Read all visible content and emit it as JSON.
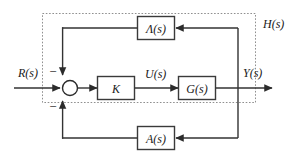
{
  "diagram": {
    "colors": {
      "line": "#333333",
      "block_border": "#3a3a3a",
      "block_fill": "#ffffff",
      "dotted_boundary": "#8a8a8a",
      "text": "#1a1a1a",
      "background": "#ffffff"
    },
    "boundary": {
      "label": "H(s)",
      "style": "dotted"
    },
    "signals": {
      "input": "R(s)",
      "intermediate": "U(s)",
      "output": "Y(s)"
    },
    "summing_junction": {
      "name": "summing-junction",
      "sign_top": "−",
      "sign_bottom": "−"
    },
    "blocks": [
      {
        "id": "lambda",
        "label": "Λ(s)"
      },
      {
        "id": "gain",
        "label": "K"
      },
      {
        "id": "plant",
        "label": "G(s)"
      },
      {
        "id": "sensor",
        "label": "A(s)"
      }
    ]
  }
}
